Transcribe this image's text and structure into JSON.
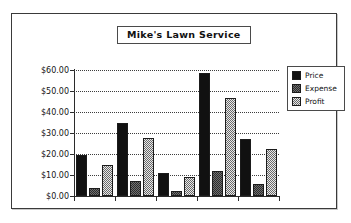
{
  "chart_data": {
    "type": "bar",
    "title": "Mike's Lawn Service",
    "xlabel": "",
    "ylabel": "",
    "ylim": [
      0,
      60
    ],
    "ytick_labels": [
      "$0.00",
      "$10.00",
      "$20.00",
      "$30.00",
      "$40.00",
      "$50.00",
      "$60.00"
    ],
    "ytick_values": [
      0,
      10,
      20,
      30,
      40,
      50,
      60
    ],
    "grid": true,
    "legend_position": "right",
    "categories": [
      "",
      "",
      "",
      "",
      ""
    ],
    "series": [
      {
        "name": "Price",
        "values": [
          19.5,
          34.8,
          11.0,
          58.5,
          27.3
        ],
        "color": "#111111"
      },
      {
        "name": "Expense",
        "values": [
          3.8,
          7.0,
          2.3,
          12.0,
          5.8
        ],
        "color": "#6f6f6f"
      },
      {
        "name": "Profit",
        "values": [
          15.0,
          27.8,
          9.0,
          46.5,
          22.2
        ],
        "color": "#e8e8e8"
      }
    ]
  },
  "legend": {
    "items": [
      {
        "label": "Price"
      },
      {
        "label": "Expense"
      },
      {
        "label": "Profit"
      }
    ]
  },
  "colors": {
    "price": "#111111",
    "expense": "#6f6f6f",
    "profit": "#e8e8e8",
    "border": "#3a3a3a",
    "grid": "#3d3d3d",
    "background": "#ffffff"
  }
}
